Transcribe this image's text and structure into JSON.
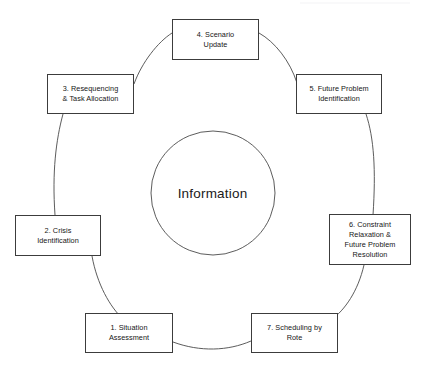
{
  "diagram": {
    "type": "cycle",
    "center_label": "Information",
    "stroke_color": "#3c3c3c",
    "background_color": "#ffffff",
    "text_color": "#161616",
    "nodes": [
      {
        "id": "node-1",
        "label": "1. Situation\nAssessment",
        "position": "bottom-left",
        "x": 85,
        "y": 313,
        "w": 88,
        "h": 40
      },
      {
        "id": "node-2",
        "label": "2. Crisis\nIdentification",
        "position": "left",
        "x": 15,
        "y": 215,
        "w": 86,
        "h": 41
      },
      {
        "id": "node-3",
        "label": "3. Resequencing\n& Task Allocation",
        "position": "upper-left",
        "x": 47,
        "y": 74,
        "w": 87,
        "h": 40
      },
      {
        "id": "node-4",
        "label": "4. Scenario\nUpdate",
        "position": "top",
        "x": 172,
        "y": 19,
        "w": 87,
        "h": 41
      },
      {
        "id": "node-5",
        "label": "5. Future Problem\nIdentification",
        "position": "upper-right",
        "x": 296,
        "y": 74,
        "w": 86,
        "h": 40
      },
      {
        "id": "node-6",
        "label": "6. Constraint\nRelaxation &\nFuture Problem\nResolution",
        "position": "right",
        "x": 329,
        "y": 214,
        "w": 82,
        "h": 51
      },
      {
        "id": "node-7",
        "label": "7. Scheduling by\nRote",
        "position": "bottom-right",
        "x": 251,
        "y": 313,
        "w": 87,
        "h": 40
      }
    ],
    "inner_circle": {
      "cx": 213,
      "cy": 193,
      "r": 62
    },
    "outer_ring": {
      "cx": 213,
      "cy": 186,
      "r": 160
    }
  }
}
